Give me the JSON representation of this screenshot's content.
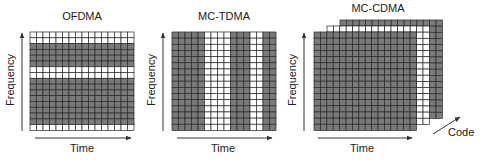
{
  "panels": [
    {
      "title": "OFDMA",
      "x_label": "Time",
      "y_label": "Frequency",
      "grid": {
        "x": 30,
        "y": 32,
        "cols": 16,
        "rows": 16,
        "cell_w": 6.5,
        "cell_h": 6.15
      },
      "row_pattern_top_to_bottom": [
        "W",
        "W",
        "G",
        "G",
        "G",
        "G",
        "W",
        "W",
        "G",
        "G",
        "G",
        "G",
        "G",
        "G",
        "G",
        "G",
        "W"
      ],
      "pattern_note": "rows shaded: white=unallocated, gray=allocated per user across frequency"
    },
    {
      "title": "MC-TDMA",
      "x_label": "Time",
      "y_label": "Frequency",
      "grid": {
        "x": 172,
        "y": 32,
        "cols": 16,
        "rows": 16,
        "cell_w": 6.5,
        "cell_h": 6.15
      },
      "col_pattern_left_to_right": [
        "G",
        "G",
        "G",
        "G",
        "G",
        "W",
        "W",
        "W",
        "W",
        "G",
        "G",
        "G",
        "W",
        "W",
        "G",
        "G"
      ]
    },
    {
      "title": "MC-CDMA",
      "x_label": "Time",
      "y_label": "Frequency",
      "z_label": "Code",
      "layers": [
        {
          "name": "back",
          "fill": "gray",
          "x": 340,
          "y": 20
        },
        {
          "name": "middle",
          "fill": "white",
          "x": 327,
          "y": 26
        },
        {
          "name": "front",
          "fill": "gray",
          "x": 314,
          "y": 32
        }
      ],
      "grid": {
        "cols": 16,
        "rows": 16,
        "cell_w": 6.4,
        "cell_h": 6.15
      }
    }
  ],
  "colors": {
    "gray": "#7a7a7a",
    "white": "#ffffff",
    "line": "#2a2a2a",
    "axis": "#333333"
  }
}
